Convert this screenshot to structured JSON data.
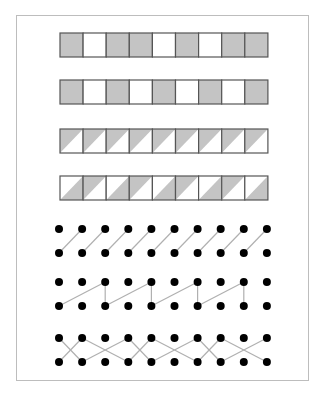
{
  "colors": {
    "frame": "#bdbdbd",
    "cell_border": "#555555",
    "cell_fill": "#c4c4c4",
    "cell_empty": "#ffffff",
    "dot": "#000000",
    "edge": "#b0b0b0"
  },
  "grid": {
    "x0": 60,
    "cell_w": 23.1,
    "cell_h": 24,
    "count": 9
  },
  "strips": [
    {
      "name": "strip-1",
      "y": 33,
      "type": "solid",
      "cells": [
        "G",
        "W",
        "G",
        "G",
        "W",
        "G",
        "W",
        "G",
        "G"
      ]
    },
    {
      "name": "strip-2",
      "y": 80,
      "type": "solid",
      "cells": [
        "G",
        "W",
        "G",
        "W",
        "G",
        "W",
        "G",
        "W",
        "G"
      ]
    },
    {
      "name": "strip-3",
      "y": 129,
      "type": "triangle",
      "cells": [
        "UL",
        "UL",
        "UL",
        "UL",
        "UL",
        "UL",
        "UL",
        "UL",
        "UL"
      ]
    },
    {
      "name": "strip-4",
      "y": 176,
      "type": "triangle",
      "cells": [
        "LR",
        "UL",
        "LR",
        "UL",
        "LR",
        "UL",
        "LR",
        "UL",
        "LR"
      ]
    }
  ],
  "dots": {
    "x0": 59,
    "dx": 23.1,
    "count": 10,
    "radius": 4
  },
  "dot_diagrams": [
    {
      "name": "dot-diagram-1",
      "top_y": 229,
      "bottom_y": 253,
      "edges": [
        [
          "b",
          0,
          "t",
          1
        ],
        [
          "b",
          1,
          "t",
          2
        ],
        [
          "b",
          2,
          "t",
          3
        ],
        [
          "b",
          3,
          "t",
          4
        ],
        [
          "b",
          4,
          "t",
          5
        ],
        [
          "b",
          5,
          "t",
          6
        ],
        [
          "b",
          6,
          "t",
          7
        ],
        [
          "b",
          7,
          "t",
          8
        ],
        [
          "b",
          8,
          "t",
          9
        ]
      ]
    },
    {
      "name": "dot-diagram-2",
      "top_y": 282,
      "bottom_y": 306,
      "edges": [
        [
          "b",
          0,
          "t",
          2
        ],
        [
          "t",
          2,
          "b",
          2
        ],
        [
          "b",
          2,
          "t",
          4
        ],
        [
          "t",
          4,
          "b",
          4
        ],
        [
          "b",
          4,
          "t",
          6
        ],
        [
          "t",
          6,
          "b",
          6
        ],
        [
          "b",
          6,
          "t",
          8
        ],
        [
          "t",
          8,
          "b",
          8
        ]
      ]
    },
    {
      "name": "dot-diagram-3",
      "top_y": 338,
      "bottom_y": 362,
      "edges": [
        [
          "t",
          0,
          "b",
          1
        ],
        [
          "b",
          0,
          "t",
          1
        ],
        [
          "t",
          1,
          "b",
          3
        ],
        [
          "b",
          1,
          "t",
          3
        ],
        [
          "t",
          3,
          "b",
          4
        ],
        [
          "b",
          3,
          "t",
          4
        ],
        [
          "t",
          4,
          "b",
          6
        ],
        [
          "b",
          4,
          "t",
          6
        ],
        [
          "t",
          6,
          "b",
          7
        ],
        [
          "b",
          6,
          "t",
          7
        ],
        [
          "t",
          7,
          "b",
          9
        ],
        [
          "b",
          7,
          "t",
          9
        ]
      ]
    }
  ]
}
